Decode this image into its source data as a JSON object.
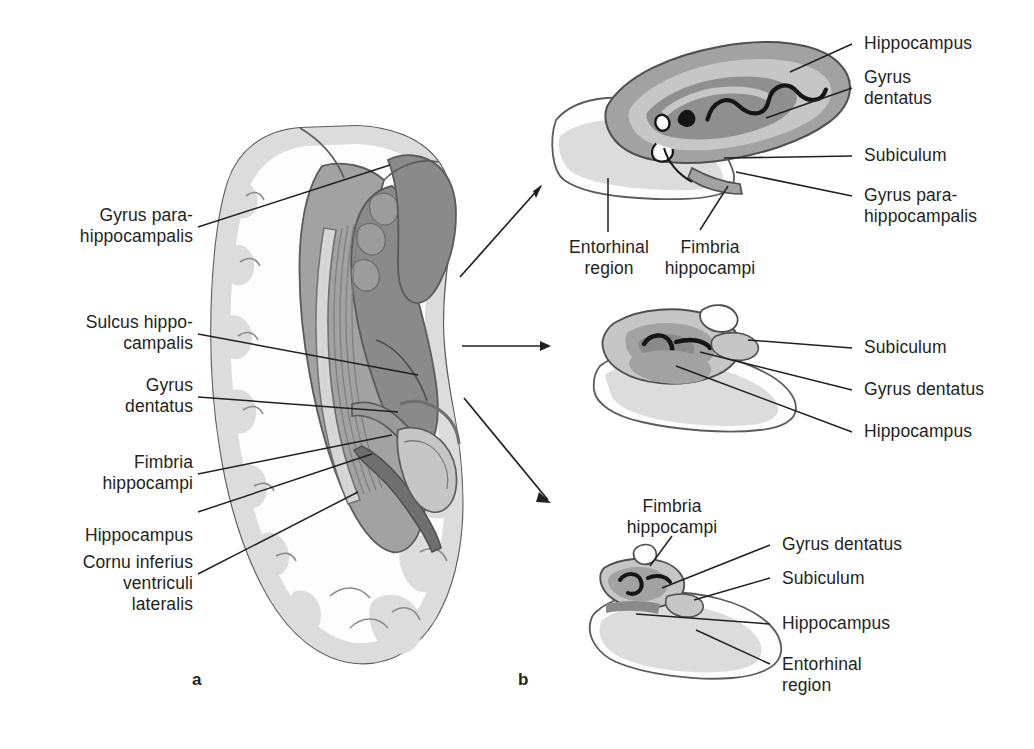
{
  "figure": {
    "panels": [
      {
        "letter": "a",
        "name": "coronal-hemisphere-overview"
      },
      {
        "letter": "b",
        "name": "serial-section-insets"
      }
    ],
    "colors": {
      "ink": "#231f20",
      "outline": "#5b5b5b",
      "white_matter": "#fdfdfd",
      "cortex_light": "#dcdcdc",
      "cortex_mid": "#c6c6c6",
      "gray_mid": "#a2a2a2",
      "gray_dark": "#8a8a8a",
      "gray_darker": "#757575",
      "near_black": "#1a1a1a"
    }
  },
  "panel_a": {
    "letter": "a",
    "labels": [
      {
        "id": "gyrus-parahippocampalis",
        "text": "Gyrus para-\nhippocampalis"
      },
      {
        "id": "sulcus-hippocampalis",
        "text": "Sulcus hippo-\ncampalis"
      },
      {
        "id": "gyrus-dentatus",
        "text": "Gyrus\ndentatus"
      },
      {
        "id": "fimbria-hippocampi",
        "text": "Fimbria\nhippocampi"
      },
      {
        "id": "hippocampus",
        "text": "Hippocampus"
      },
      {
        "id": "cornu-inferius",
        "text": "Cornu inferius\nventriculi\nlateralis"
      }
    ]
  },
  "panel_b": {
    "letter": "b",
    "insets": [
      {
        "id": "inset-top",
        "name": "section-through-body",
        "labels_right": [
          {
            "id": "hippocampus",
            "text": "Hippocampus"
          },
          {
            "id": "gyrus-dentatus",
            "text": "Gyrus\ndentatus"
          },
          {
            "id": "subiculum",
            "text": "Subiculum"
          },
          {
            "id": "gyrus-parahippocampalis",
            "text": "Gyrus para-\nhippocampalis"
          }
        ],
        "labels_below": [
          {
            "id": "entorhinal-region",
            "text": "Entorhinal\nregion"
          },
          {
            "id": "fimbria-hippocampi",
            "text": "Fimbria\nhippocampi"
          }
        ]
      },
      {
        "id": "inset-middle",
        "name": "section-through-mid-body",
        "labels_right": [
          {
            "id": "subiculum",
            "text": "Subiculum"
          },
          {
            "id": "gyrus-dentatus",
            "text": "Gyrus dentatus"
          },
          {
            "id": "hippocampus",
            "text": "Hippocampus"
          }
        ]
      },
      {
        "id": "inset-bottom",
        "name": "section-through-tail",
        "labels_above": [
          {
            "id": "fimbria-hippocampi",
            "text": "Fimbria\nhippocampi"
          }
        ],
        "labels_right": [
          {
            "id": "gyrus-dentatus",
            "text": "Gyrus dentatus"
          },
          {
            "id": "subiculum",
            "text": "Subiculum"
          },
          {
            "id": "hippocampus",
            "text": "Hippocampus"
          },
          {
            "id": "entorhinal-region",
            "text": "Entorhinal\nregion"
          }
        ]
      }
    ]
  }
}
